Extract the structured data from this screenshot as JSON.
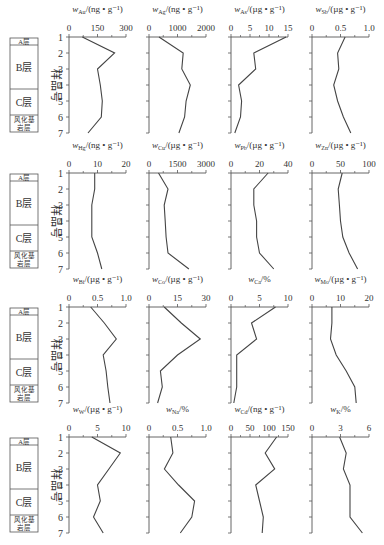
{
  "chart_data": {
    "type": "line",
    "ylabel": "样品号",
    "y_ticks": [
      1,
      2,
      3,
      4,
      5,
      6,
      7
    ],
    "layers": [
      {
        "name": "A层",
        "from": 1,
        "to": 1.3
      },
      {
        "name": "B层",
        "from": 1.3,
        "to": 4.3
      },
      {
        "name": "C层",
        "from": 4.3,
        "to": 6.0
      },
      {
        "name": "风化基岩层",
        "from": 6.0,
        "to": 7.0
      }
    ],
    "panels": [
      {
        "element": "Au",
        "title": "w_Au/(ng·g⁻¹)",
        "sub": "Au",
        "unit": "/(ng • g⁻¹)",
        "xlim": [
          0,
          300
        ],
        "ticks": [
          0,
          150,
          300
        ],
        "values": [
          70,
          240,
          150,
          165,
          175,
          170,
          100
        ]
      },
      {
        "element": "Ag",
        "title": "w_Ag/(ng·g⁻¹)",
        "sub": "Ag",
        "unit": "/(ng • g⁻¹)",
        "xlim": [
          0,
          2000
        ],
        "ticks": [
          0,
          1000,
          2000
        ],
        "values": [
          350,
          1200,
          1150,
          1450,
          1300,
          1250,
          1050
        ]
      },
      {
        "element": "As",
        "title": "w_As/(µg·g⁻¹)",
        "sub": "As",
        "unit": "/(µg • g⁻¹)",
        "xlim": [
          0,
          15
        ],
        "ticks": [
          0,
          5,
          10,
          15
        ],
        "values": [
          14.5,
          6,
          6.5,
          2,
          2.8,
          2.5,
          1
        ]
      },
      {
        "element": "Sb",
        "title": "w_Sb/(µg·g⁻¹)",
        "sub": "Sb",
        "unit": "/(µg • g⁻¹)",
        "xlim": [
          0,
          1
        ],
        "ticks": [
          0,
          0.5,
          1.0
        ],
        "tick_labels": [
          "0",
          "0.5",
          "1.0"
        ],
        "values": [
          0.58,
          0.45,
          0.47,
          0.38,
          0.45,
          0.55,
          0.68
        ]
      },
      {
        "element": "Hg",
        "title": "w_Hg/(ng·g⁻¹)",
        "sub": "Hg",
        "unit": "/(ng • g⁻¹)",
        "xlim": [
          0,
          20
        ],
        "ticks": [
          0,
          10,
          20
        ],
        "values": [
          9,
          9,
          8,
          8,
          8,
          10,
          11.5
        ]
      },
      {
        "element": "Cu",
        "title": "w_Cu/(µg·g⁻¹)",
        "sub": "Cu",
        "unit": "/(µg • g⁻¹)",
        "xlim": [
          0,
          3000
        ],
        "ticks": [
          0,
          1500,
          3000
        ],
        "values": [
          500,
          1000,
          800,
          850,
          900,
          1000,
          2100
        ]
      },
      {
        "element": "Pb",
        "title": "w_Pb/(µg·g⁻¹)",
        "sub": "Pb",
        "unit": "/(µg • g⁻¹)",
        "xlim": [
          0,
          40
        ],
        "ticks": [
          0,
          20,
          40
        ],
        "values": [
          26,
          16,
          16,
          18,
          18,
          20,
          30
        ]
      },
      {
        "element": "Zn",
        "title": "w_Zn/(µg·g⁻¹)",
        "sub": "Zn",
        "unit": "/(µg • g⁻¹)",
        "xlim": [
          0,
          100
        ],
        "ticks": [
          0,
          50,
          100
        ],
        "values": [
          53,
          46,
          48,
          50,
          54,
          65,
          80
        ]
      },
      {
        "element": "Bi",
        "title": "w_Bi/(µg·g⁻¹)",
        "sub": "Bi",
        "unit": "/(µg • g⁻¹)",
        "xlim": [
          0,
          1
        ],
        "ticks": [
          0,
          0.5,
          1.0
        ],
        "tick_labels": [
          "0",
          "0.5",
          "1.0"
        ],
        "values": [
          0.38,
          0.62,
          0.83,
          0.6,
          0.65,
          0.68,
          0.72
        ]
      },
      {
        "element": "Co",
        "title": "w_Co/(µg·g⁻¹)",
        "sub": "Co",
        "unit": "/(µg • g⁻¹)",
        "xlim": [
          0,
          30
        ],
        "ticks": [
          0,
          15,
          30
        ],
        "values": [
          8,
          17,
          27,
          15,
          6,
          7,
          4.5
        ]
      },
      {
        "element": "Ca",
        "title": "w_Ca/%",
        "sub": "Ca",
        "unit": "/%",
        "xlim": [
          0,
          10
        ],
        "ticks": [
          0,
          5,
          10
        ],
        "values": [
          7.8,
          3.6,
          4.5,
          1,
          1,
          1,
          0.5
        ]
      },
      {
        "element": "Mo",
        "title": "w_Mo/(µg·g⁻¹)",
        "sub": "Mo",
        "unit": "/(µg • g⁻¹)",
        "xlim": [
          0,
          20
        ],
        "ticks": [
          0,
          10,
          20
        ],
        "values": [
          7,
          7,
          6.5,
          8.5,
          12,
          15,
          15.5
        ]
      },
      {
        "element": "W",
        "title": "w_W/(µg·g⁻¹)",
        "sub": "W",
        "unit": "/(µg • g⁻¹)",
        "xlim": [
          0,
          10
        ],
        "ticks": [
          0,
          5,
          10
        ],
        "values": [
          4,
          9,
          7,
          5,
          5.5,
          4.3,
          6
        ]
      },
      {
        "element": "Na",
        "title": "w_Na/%",
        "sub": "Na",
        "unit": "/%",
        "xlim": [
          0,
          1
        ],
        "ticks": [
          0,
          0.5,
          1.0
        ],
        "tick_labels": [
          "0",
          "0.5",
          "1.0"
        ],
        "values": [
          0.38,
          0.42,
          0.27,
          0.52,
          0.8,
          0.75,
          0.55
        ]
      },
      {
        "element": "Cd",
        "title": "w_Cd/(ng·g⁻¹)",
        "sub": "Cd",
        "unit": "/(ng • g⁻¹)",
        "xlim": [
          0,
          150
        ],
        "ticks": [
          0,
          50,
          100,
          150
        ],
        "values": [
          120,
          90,
          115,
          65,
          75,
          85,
          82
        ]
      },
      {
        "element": "K",
        "title": "w_K/%",
        "sub": "K",
        "unit": "/%",
        "xlim": [
          0,
          6
        ],
        "ticks": [
          0,
          3,
          6
        ],
        "values": [
          2.9,
          3.6,
          3.3,
          4,
          4,
          4,
          5.3
        ]
      }
    ],
    "grid": false,
    "legend": "none"
  },
  "legend_column": {
    "layers": [
      "A层",
      "B层",
      "C层",
      "风化基",
      "岩层"
    ]
  },
  "axis": {
    "ylabel": "样品号",
    "sample_numbers": [
      "1",
      "2",
      "3",
      "4",
      "5",
      "6",
      "7"
    ]
  }
}
